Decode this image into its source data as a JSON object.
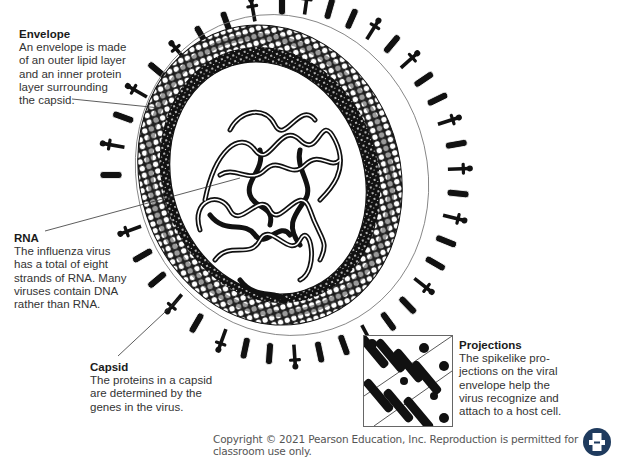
{
  "labels": {
    "envelope": {
      "title": "Envelope",
      "body": "An envelope is made\nof an outer lipid layer\nand an inner protein\nlayer surrounding\nthe capsid."
    },
    "rna": {
      "title": "RNA",
      "body": "The influenza virus\nhas a total of eight\nstrands of RNA. Many\nviruses contain DNA\nrather than RNA."
    },
    "capsid": {
      "title": "Capsid",
      "body": "The proteins in a capsid\nare determined by the\ngenes in the virus."
    },
    "projections": {
      "title": "Projections",
      "body": "The spikelike pro-\njections on the viral\nenvelope help the\nvirus recognize and\nattach to a host cell."
    }
  },
  "footer": {
    "copyright": "Copyright © 2021 Pearson Education, Inc. Reproduction is permitted for classroom use only."
  },
  "icons": {
    "print": "print-icon"
  },
  "colors": {
    "ink": "#111111",
    "lipid_light": "#ffffff",
    "lipid_gray": "#9a9a9a",
    "print_button": "#1f3b5e"
  }
}
